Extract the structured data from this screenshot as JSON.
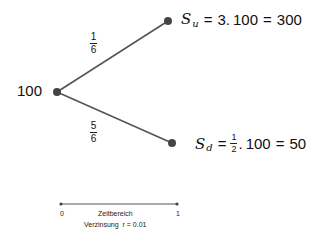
{
  "tree": {
    "root": {
      "value": "100"
    },
    "up_branch": {
      "probability": {
        "numerator": "1",
        "denominator": "6"
      },
      "formula": {
        "symbol": "S",
        "subscript": "u",
        "eq1": "=",
        "factor": "3.",
        "base": "100",
        "eq2": "=",
        "result": "300"
      }
    },
    "down_branch": {
      "probability": {
        "numerator": "5",
        "denominator": "6"
      },
      "formula": {
        "symbol": "S",
        "subscript": "d",
        "eq1": "=",
        "factor_fraction": {
          "numerator": "1",
          "denominator": "2"
        },
        "dot": ".",
        "base": "100",
        "eq2": "=",
        "result": "50"
      }
    }
  },
  "timeline": {
    "start": "0",
    "end": "1",
    "title": "Zeitbereich",
    "rate_label": "Verzinsung  r = 0.01"
  },
  "colors": {
    "line": "#555555",
    "node": "#444444",
    "text": "#111111"
  }
}
